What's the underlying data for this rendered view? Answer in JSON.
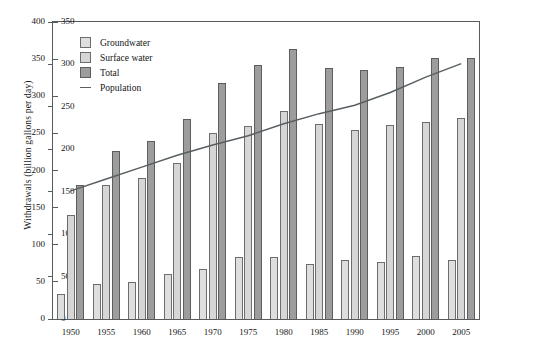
{
  "chart_data": {
    "type": "bar",
    "title": "",
    "xlabel": "",
    "ylabel": "Withdrawals (billion gallons per day)",
    "y2label": "Population (millions)",
    "ylim": [
      0,
      400
    ],
    "y2lim": [
      0,
      350
    ],
    "yticks": [
      0,
      50,
      100,
      150,
      200,
      250,
      300,
      350,
      400
    ],
    "y2ticks": [
      0,
      50,
      100,
      150,
      200,
      250,
      300,
      350
    ],
    "grid": false,
    "legend_position": "upper-left",
    "categories": [
      "1950",
      "1955",
      "1960",
      "1965",
      "1970",
      "1975",
      "1980",
      "1985",
      "1990",
      "1995",
      "2000",
      "2005"
    ],
    "series": [
      {
        "name": "Groundwater",
        "axis": "left",
        "color": "#dedede",
        "type": "bar",
        "values": [
          34,
          47,
          50,
          60,
          68,
          83,
          84,
          74,
          79,
          77,
          85,
          80
        ]
      },
      {
        "name": "Surface water",
        "axis": "left",
        "color": "#d6d6d6",
        "type": "bar",
        "values": [
          140,
          180,
          190,
          210,
          250,
          260,
          280,
          262,
          255,
          261,
          266,
          271
        ]
      },
      {
        "name": "Total",
        "axis": "left",
        "color": "#9d9d9d",
        "type": "bar",
        "values": [
          180,
          226,
          240,
          270,
          318,
          342,
          363,
          338,
          336,
          339,
          351,
          351
        ]
      },
      {
        "name": "Population",
        "axis": "right",
        "color": "#585f63",
        "type": "line",
        "values": [
          151,
          165,
          179,
          193,
          205,
          216,
          230,
          242,
          252,
          267,
          285,
          301
        ]
      }
    ]
  },
  "legend": {
    "items": [
      {
        "label": "Groundwater",
        "marker": "swatch-groundwater"
      },
      {
        "label": "Surface water",
        "marker": "swatch-surface"
      },
      {
        "label": "Total",
        "marker": "swatch-total"
      },
      {
        "label": "Population",
        "marker": "line-population"
      }
    ]
  },
  "colors": {
    "groundwater": "#dedede",
    "surface_water": "#d6d6d6",
    "total": "#9d9d9d",
    "population_line": "#585f63",
    "axis": "#555b5e",
    "background": "#ffffff"
  }
}
